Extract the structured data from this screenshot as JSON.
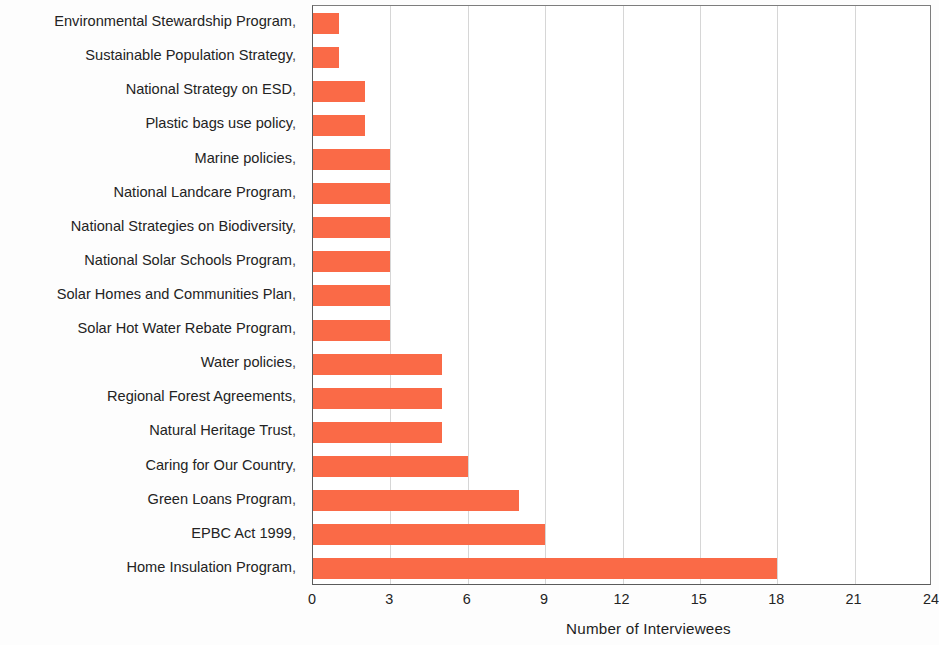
{
  "chart_data": {
    "type": "bar",
    "orientation": "horizontal",
    "title": "",
    "xlabel": "Number of Interviewees",
    "ylabel": "",
    "xlim": [
      0,
      24
    ],
    "xticks": [
      "0",
      "3",
      "6",
      "9",
      "12",
      "15",
      "18",
      "21",
      "24"
    ],
    "xtick_values": [
      0,
      3,
      6,
      9,
      12,
      15,
      18,
      21,
      24
    ],
    "grid": "vertical",
    "legend": "none",
    "bar_color": "#fa6a47",
    "categories": [
      "Environmental Stewardship Program",
      "Sustainable Population Strategy",
      "National Strategy on ESD",
      "Plastic bags use policy",
      "Marine policies",
      "National Landcare Program",
      "National Strategies on Biodiversity",
      "National Solar Schools Program",
      "Solar Homes and Communities Plan",
      "Solar Hot Water Rebate Program",
      "Water policies",
      "Regional Forest Agreements",
      "Natural Heritage Trust",
      "Caring for Our Country",
      "Green Loans Program",
      "EPBC Act 1999",
      "Home Insulation Program"
    ],
    "values": [
      1,
      1,
      2,
      2,
      3,
      3,
      3,
      3,
      3,
      3,
      5,
      5,
      5,
      6,
      8,
      9,
      18
    ]
  },
  "axis": {
    "x_title": "Number of Interviewees"
  },
  "marks": {
    "tick_glyph": ","
  }
}
